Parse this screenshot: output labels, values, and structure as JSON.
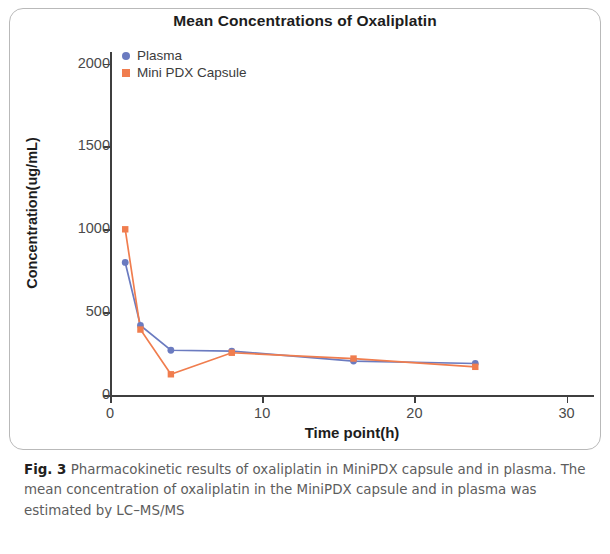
{
  "figure": {
    "label": "Fig. 3",
    "caption": "Pharmacokinetic results of oxaliplatin in MiniPDX capsule and in plasma. The mean concentration of oxaliplatin in the MiniPDX capsule and in plasma was estimated by LC–MS/MS"
  },
  "chart_data": {
    "type": "line",
    "title": "Mean Concentrations of Oxaliplatin",
    "xlabel": "Time point(h)",
    "ylabel": "Concentration(ug/mL)",
    "xlim": [
      0,
      31.8
    ],
    "ylim": [
      0,
      2070
    ],
    "xticks": [
      0,
      10,
      20,
      30
    ],
    "xtick_labels": [
      "0",
      "10",
      "20",
      "30"
    ],
    "yticks": [
      0,
      500,
      1000,
      1500,
      2000
    ],
    "ytick_labels": [
      "0",
      "500",
      "1000",
      "1500",
      "2000"
    ],
    "grid": false,
    "legend_position": "top-left-inside",
    "x": [
      1,
      2,
      4,
      8,
      16,
      24
    ],
    "series": [
      {
        "name": "Plasma",
        "marker": "circle",
        "color": "#6b7bc0",
        "values": [
          800,
          420,
          270,
          265,
          205,
          190
        ]
      },
      {
        "name": "Mini PDX Capsule",
        "marker": "square",
        "color": "#f07d4e",
        "values": [
          1000,
          395,
          125,
          255,
          220,
          170
        ]
      }
    ]
  }
}
